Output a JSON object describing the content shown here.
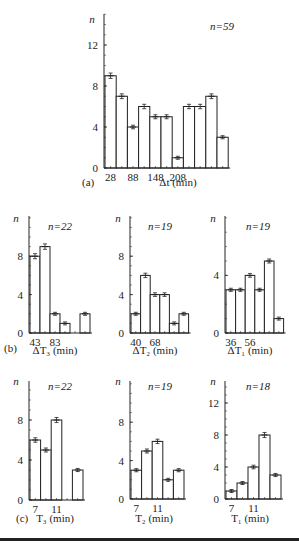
{
  "chart_data": [
    {
      "id": "a",
      "type": "bar",
      "panel_label": "(a)",
      "title": "",
      "annotation": "n = 59",
      "ylabel": "n",
      "xlabel": "Δt (min)",
      "xtick_labels": [
        "28",
        "88",
        "148",
        "208"
      ],
      "yticks": [
        0,
        4,
        8,
        12
      ],
      "ylim": [
        0,
        14
      ],
      "categories": [
        "28-58",
        "58-88",
        "88-118",
        "118-148",
        "148-178",
        "178-208",
        "208-238",
        "238-268",
        "268-298",
        "298-328",
        "328-358"
      ],
      "values": [
        9,
        7,
        4,
        6,
        5,
        5,
        1,
        6,
        6,
        7,
        3
      ],
      "error_bars": true,
      "grid": false
    },
    {
      "id": "b1",
      "type": "bar",
      "panel_label": "(b)",
      "annotation": "n = 22",
      "ylabel": "n",
      "xlabel": "ΔT₃ (min)",
      "xtick_labels": [
        "43",
        "83"
      ],
      "yticks": [
        0,
        4,
        8
      ],
      "ylim": [
        0,
        12
      ],
      "values": [
        8,
        9,
        2,
        1,
        0,
        2
      ],
      "error_bars": true,
      "grid": false
    },
    {
      "id": "b2",
      "type": "bar",
      "panel_label": "",
      "annotation": "n = 19",
      "ylabel": "n",
      "xlabel": "ΔT₂ (min)",
      "xtick_labels": [
        "40",
        "68"
      ],
      "yticks": [
        0,
        4,
        8
      ],
      "ylim": [
        0,
        12
      ],
      "values": [
        2,
        6,
        4,
        4,
        1,
        2
      ],
      "error_bars": true,
      "grid": false
    },
    {
      "id": "b3",
      "type": "bar",
      "panel_label": "",
      "annotation": "n = 19",
      "ylabel": "n",
      "xlabel": "ΔT₁ (min)",
      "xtick_labels": [
        "36",
        "56"
      ],
      "yticks": [
        0,
        4
      ],
      "ylim": [
        0,
        7.5
      ],
      "values": [
        3,
        3,
        4,
        3,
        5,
        1
      ],
      "error_bars": true,
      "grid": false
    },
    {
      "id": "c1",
      "type": "bar",
      "panel_label": "(c)",
      "annotation": "n = 22",
      "ylabel": "n",
      "xlabel": "T₃ (min)",
      "xtick_labels": [
        "7",
        "11"
      ],
      "yticks": [
        0,
        4,
        8
      ],
      "ylim": [
        0,
        12
      ],
      "values": [
        6,
        5,
        8,
        0,
        3
      ],
      "error_bars": true,
      "grid": false
    },
    {
      "id": "c2",
      "type": "bar",
      "panel_label": "",
      "annotation": "n = 19",
      "ylabel": "n",
      "xlabel": "T₂ (min)",
      "xtick_labels": [
        "7",
        "11"
      ],
      "yticks": [
        0,
        4,
        8
      ],
      "ylim": [
        0,
        12
      ],
      "values": [
        3,
        5,
        6,
        2,
        3
      ],
      "error_bars": true,
      "grid": false
    },
    {
      "id": "c3",
      "type": "bar",
      "panel_label": "",
      "annotation": "n = 18",
      "ylabel": "n",
      "xlabel": "T₁ (min)",
      "xtick_labels": [
        "7",
        "11"
      ],
      "yticks": [
        0,
        4,
        8,
        12
      ],
      "ylim": [
        0,
        14
      ],
      "values": [
        1,
        2,
        4,
        8,
        3
      ],
      "error_bars": true,
      "grid": false
    }
  ],
  "layout": [
    {
      "x0": 104,
      "y0": 168,
      "ytop": 14,
      "pxPerUnit": 10.25,
      "barW": 11.2,
      "ticksAt": [
        0,
        2,
        4,
        6
      ],
      "xlabelX": 178,
      "xlabelY": 186,
      "panelX": 82,
      "panelY": 186,
      "annoX": 222,
      "annoY": 30,
      "nX": 92,
      "nY": 23,
      "ytickX": 98,
      "extraTicks": 11
    },
    {
      "x0": 29,
      "y0": 333,
      "ytop": 216,
      "pxPerUnit": 9.6,
      "barW": 10,
      "ticksAt": [
        0,
        2
      ],
      "xlabelX": 55,
      "xlabelY": 354,
      "panelX": 4,
      "panelY": 352,
      "annoX": 60,
      "annoY": 230,
      "nX": 16,
      "nY": 222,
      "ytickX": 23,
      "extraTicks": 6
    },
    {
      "x0": 130,
      "y0": 333,
      "ytop": 216,
      "pxPerUnit": 9.6,
      "barW": 9.6,
      "ticksAt": [
        0,
        2
      ],
      "xlabelX": 155,
      "xlabelY": 354,
      "panelX": 0,
      "panelY": 0,
      "annoX": 160,
      "annoY": 230,
      "nX": 118,
      "nY": 222,
      "ytickX": 124,
      "extraTicks": 6
    },
    {
      "x0": 225,
      "y0": 333,
      "ytop": 216,
      "pxPerUnit": 14.4,
      "barW": 9.6,
      "ticksAt": [
        0,
        2
      ],
      "xlabelX": 250,
      "xlabelY": 354,
      "panelX": 0,
      "panelY": 0,
      "annoX": 258,
      "annoY": 230,
      "nX": 213,
      "nY": 222,
      "ytickX": 219,
      "extraTicks": 6
    },
    {
      "x0": 29,
      "y0": 500,
      "ytop": 381,
      "pxPerUnit": 10,
      "barW": 10.6,
      "ticksAt": [
        0,
        2
      ],
      "xlabelX": 55,
      "xlabelY": 522,
      "panelX": 16,
      "panelY": 522,
      "annoX": 60,
      "annoY": 390,
      "nX": 16,
      "nY": 385,
      "ytickX": 23,
      "extraTicks": 5
    },
    {
      "x0": 130,
      "y0": 499,
      "ytop": 381,
      "pxPerUnit": 9.6,
      "barW": 10.6,
      "ticksAt": [
        0,
        2
      ],
      "xlabelX": 154,
      "xlabelY": 522,
      "panelX": 0,
      "panelY": 0,
      "annoX": 160,
      "annoY": 390,
      "nX": 118,
      "nY": 385,
      "ytickX": 124,
      "extraTicks": 5
    },
    {
      "x0": 225,
      "y0": 499,
      "ytop": 381,
      "pxPerUnit": 8,
      "barW": 11,
      "ticksAt": [
        0,
        2
      ],
      "xlabelX": 250,
      "xlabelY": 522,
      "panelX": 0,
      "panelY": 0,
      "annoX": 258,
      "annoY": 390,
      "nX": 213,
      "nY": 385,
      "ytickX": 219,
      "extraTicks": 5
    }
  ],
  "colors": {
    "ink": "#222222",
    "bar_fill": "#ffffff",
    "background": "#ffffff"
  }
}
